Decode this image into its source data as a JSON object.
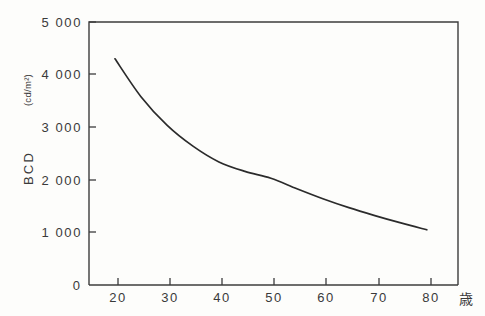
{
  "chart_data": {
    "type": "line",
    "title": "",
    "xlabel": "歳",
    "ylabel": "BCD",
    "yunit": "(cd/m²)",
    "xlim": [
      15,
      86
    ],
    "ylim": [
      0,
      5000
    ],
    "grid": false,
    "legend": "none",
    "x_ticks": [
      20,
      30,
      40,
      50,
      60,
      70,
      80
    ],
    "x_tick_labels": [
      "20",
      "30",
      "40",
      "50",
      "60",
      "70",
      "80"
    ],
    "y_ticks": [
      0,
      1000,
      2000,
      3000,
      4000,
      5000
    ],
    "y_tick_labels": [
      "0",
      "1 000",
      "2 000",
      "3 000",
      "4 000",
      "5 000"
    ],
    "series": [
      {
        "name": "BCD",
        "x": [
          20,
          25,
          30,
          35,
          40,
          45,
          50,
          55,
          60,
          65,
          70,
          75,
          80
        ],
        "values": [
          4300,
          3580,
          3040,
          2640,
          2340,
          2160,
          2030,
          1830,
          1640,
          1470,
          1320,
          1180,
          1050
        ]
      }
    ]
  },
  "axis": {
    "y_name": "BCD",
    "y_unit": "(cd/m²)",
    "x_unit": "歳",
    "zero_label": "0"
  },
  "style": {
    "curve_color": "#2b2b2b",
    "frame_color": "#3c3c3c",
    "text_color": "#3a3a3a",
    "background": "#fdfdfb"
  }
}
